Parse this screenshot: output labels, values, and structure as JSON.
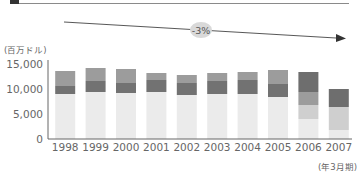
{
  "chart_data": {
    "type": "bar",
    "stacked": true,
    "title": "",
    "xlabel": "(年3月期)",
    "ylabel": "(百万ドル)",
    "ylim": [
      0,
      15000
    ],
    "yticks": [
      0,
      5000,
      10000,
      15000
    ],
    "ytick_labels": [
      "0",
      "5,000",
      "10,000",
      "15,000"
    ],
    "categories": [
      "1998",
      "1999",
      "2000",
      "2001",
      "2002",
      "2003",
      "2004",
      "2005",
      "2006",
      "2007"
    ],
    "series": [
      {
        "name": "segment-1",
        "color": "#ebebeb",
        "values": [
          9000,
          9400,
          9200,
          9400,
          8800,
          9000,
          9000,
          8400,
          4000,
          1800
        ]
      },
      {
        "name": "segment-2",
        "color": "#cfcfcf",
        "values": [
          0,
          0,
          0,
          0,
          0,
          0,
          0,
          0,
          2800,
          4600
        ]
      },
      {
        "name": "segment-3",
        "color": "#9c9c9c",
        "values": [
          0,
          0,
          0,
          0,
          0,
          0,
          0,
          0,
          2600,
          0
        ]
      },
      {
        "name": "segment-4",
        "color": "#727272",
        "values": [
          1600,
          2200,
          2000,
          2400,
          2400,
          2600,
          2800,
          2600,
          0,
          0
        ]
      },
      {
        "name": "segment-5",
        "color": "#9c9c9c",
        "values": [
          3000,
          2600,
          2800,
          1400,
          1600,
          1600,
          1600,
          2800,
          0,
          0
        ]
      },
      {
        "name": "segment-6",
        "color": "#6e6e6e",
        "values": [
          0,
          0,
          0,
          0,
          0,
          0,
          0,
          0,
          4000,
          3600
        ]
      }
    ],
    "totals": [
      13600,
      14200,
      14000,
      13200,
      12800,
      13200,
      13400,
      13800,
      13400,
      10000
    ],
    "annotations": [
      {
        "type": "trend-arrow",
        "label": "-3%"
      }
    ],
    "grid": false,
    "legend": "none"
  },
  "labels": {
    "unit": "(百万ドル)",
    "period": "(年3月期)",
    "trend": "-3%"
  }
}
